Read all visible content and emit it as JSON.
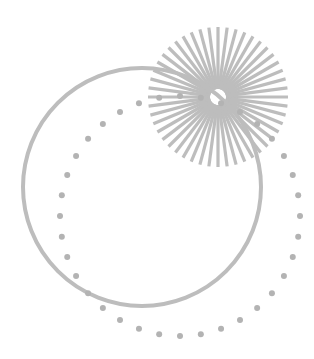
{
  "canvas": {
    "width": 314,
    "height": 359,
    "background": "#ffffff"
  },
  "colors": {
    "stroke": "#bdbdbd",
    "dot": "#b3b3b3"
  },
  "solid_circle": {
    "cx": 142,
    "cy": 187,
    "r": 119,
    "stroke_width": 4
  },
  "dotted_circle": {
    "cx": 180,
    "cy": 216,
    "r": 120,
    "dot_count": 36,
    "dot_radius": 3
  },
  "sunburst": {
    "cx": 218,
    "cy": 97,
    "r_inner": 8,
    "r_outer": 70,
    "ray_count": 48,
    "ray_width": 3.2
  }
}
